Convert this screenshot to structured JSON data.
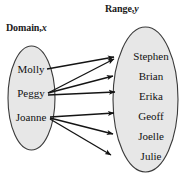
{
  "figure": {
    "type": "mapping-diagram",
    "domain": {
      "label_text": "Domain,",
      "label_var": "x",
      "items": [
        "Molly",
        "Peggy",
        "Joanne"
      ]
    },
    "range": {
      "label_text": "Range,",
      "label_var": "y",
      "items": [
        "Stephen",
        "Brian",
        "Erika",
        "Geoff",
        "Joelle",
        "Julie"
      ]
    },
    "mappings": [
      {
        "from": "Molly",
        "to": "Stephen"
      },
      {
        "from": "Peggy",
        "to": "Stephen"
      },
      {
        "from": "Peggy",
        "to": "Erika"
      },
      {
        "from": "Joanne",
        "to": "Geoff"
      },
      {
        "from": "Joanne",
        "to": "Joelle"
      },
      {
        "from": "Joanne",
        "to": "Julie"
      }
    ],
    "colors": {
      "ellipse_fill": "#e7e7e7",
      "ellipse_stroke": "#3a3a3a",
      "arrow": "#141414",
      "text": "#111111",
      "background": "#ffffff"
    }
  }
}
